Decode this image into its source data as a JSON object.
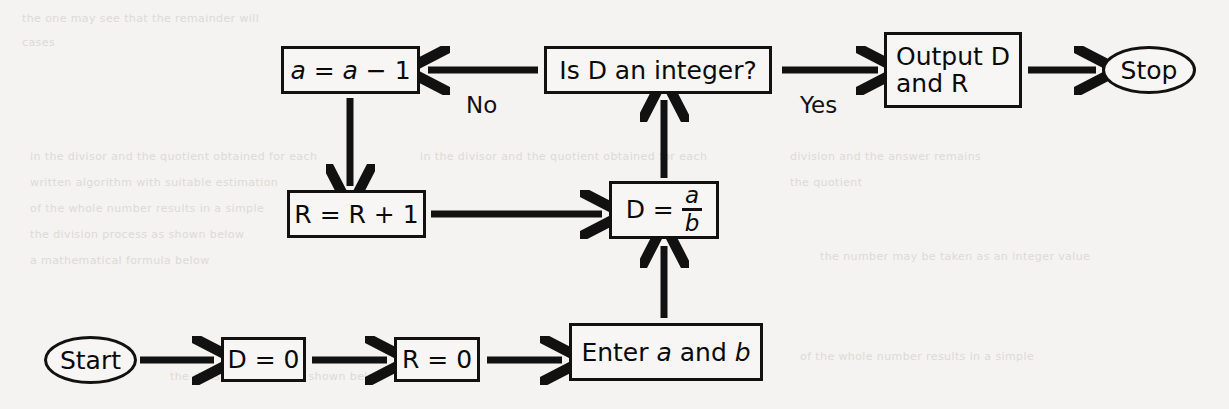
{
  "diagram": {
    "background_color": "#f4f3f1",
    "stroke_color": "#111111",
    "nodes": {
      "start": {
        "label": "Start",
        "shape": "oval"
      },
      "d_zero": {
        "label": "D = 0",
        "shape": "rect"
      },
      "r_zero": {
        "label": "R = 0",
        "shape": "rect"
      },
      "enter": {
        "prefix": "Enter ",
        "var1": "a",
        "middle": " and ",
        "var2": "b",
        "shape": "rect"
      },
      "divide": {
        "prefix": "D = ",
        "numerator": "a",
        "denominator": "b",
        "shape": "rect"
      },
      "test": {
        "label": "Is D an integer?",
        "shape": "rect"
      },
      "decrement": {
        "prefix": "",
        "var1": "a",
        "middle": " = ",
        "var2": "a",
        "suffix": " − 1",
        "shape": "rect"
      },
      "increment": {
        "label": "R = R + 1",
        "shape": "rect"
      },
      "output": {
        "line1": "Output D",
        "line2": "and R",
        "shape": "rect"
      },
      "stop": {
        "label": "Stop",
        "shape": "oval"
      }
    },
    "edge_labels": {
      "no": "No",
      "yes": "Yes"
    },
    "ghost_text": {
      "g1": "the  one  may  see  that  the  remainder  will",
      "g2": "cases",
      "g3": "in  the  divisor  and  the  quotient  obtained  for  each",
      "g4": "written  algorithm  with  suitable  estimation",
      "g5": "of  the  whole  number  results  in  a  simple",
      "g6": "the  division  process  as  shown  below",
      "g7": "a  mathematical  formula  below",
      "g8": "division  and  the  answer  remains",
      "g9": "the  quotient",
      "g10": "the  number  may  be  taken  as  an  integer  value"
    }
  }
}
